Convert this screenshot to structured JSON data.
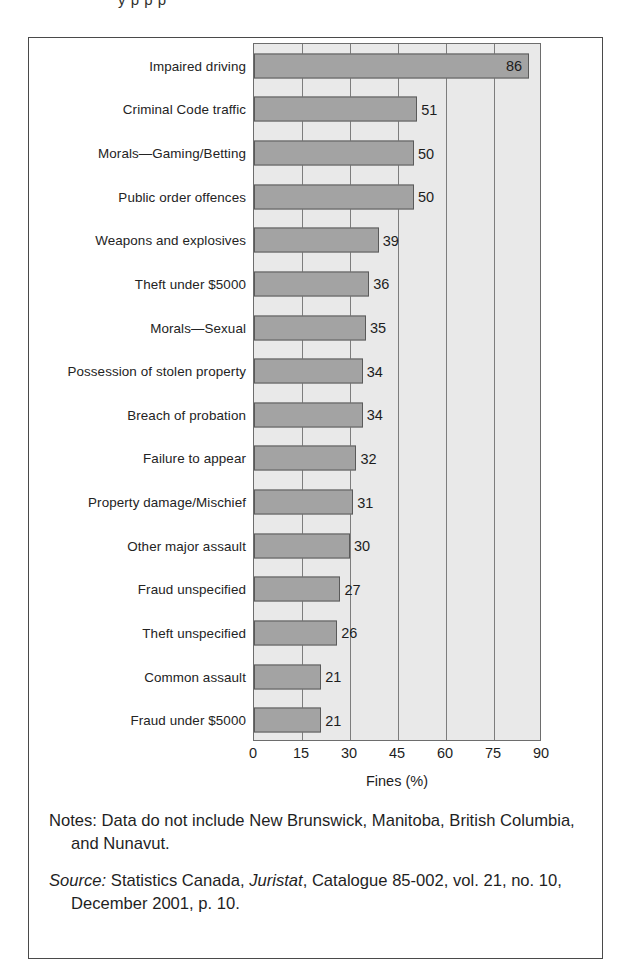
{
  "figure": {
    "clipped_title_remnant": "y    p    p    p"
  },
  "chart_data": {
    "type": "bar",
    "orientation": "horizontal",
    "title": "",
    "xlabel": "Fines (%)",
    "ylabel": "",
    "xlim": [
      0,
      90
    ],
    "xticks": [
      0,
      15,
      30,
      45,
      60,
      75,
      90
    ],
    "xtick_labels": [
      "0",
      "15",
      "30",
      "45",
      "60",
      "75",
      "90"
    ],
    "grid": "vertical gridlines at each x tick",
    "legend": "none",
    "categories": [
      "Impaired driving",
      "Criminal Code traffic",
      "Morals—Gaming/Betting",
      "Public order offences",
      "Weapons and explosives",
      "Theft under $5000",
      "Morals—Sexual",
      "Possession of stolen property",
      "Breach of probation",
      "Failure to appear",
      "Property damage/Mischief",
      "Other major assault",
      "Fraud unspecified",
      "Theft unspecified",
      "Common assault",
      "Fraud under $5000"
    ],
    "values": [
      86,
      51,
      50,
      50,
      39,
      36,
      35,
      34,
      34,
      32,
      31,
      30,
      27,
      26,
      21,
      21
    ],
    "data_labels": [
      "86",
      "51",
      "50",
      "50",
      "39",
      "36",
      "35",
      "34",
      "34",
      "32",
      "31",
      "30",
      "27",
      "26",
      "21",
      "21"
    ],
    "label_position": [
      "inside",
      "outside",
      "outside",
      "outside",
      "outside",
      "outside",
      "outside",
      "outside",
      "outside",
      "outside",
      "outside",
      "outside",
      "outside",
      "outside",
      "outside",
      "outside"
    ],
    "colors": {
      "bar_fill": "#a3a3a3",
      "bar_edge": "#5a5a5a",
      "plot_background": "#e9e9e9",
      "gridline": "#7d7d7d",
      "frame": "#4a4a4a",
      "text": "#1f1f1f"
    }
  },
  "footnotes": {
    "notes": {
      "lead": "Notes:",
      "text": "Data do not include New Brunswick, Manitoba, British Columbia, and Nunavut."
    },
    "source": {
      "lead": "Source:",
      "text_before_italic": "Statistics Canada, ",
      "italic_title": "Juristat",
      "text_after_italic": ", Catalogue 85-002, vol. 21, no. 10, December 2001, p. 10."
    }
  }
}
